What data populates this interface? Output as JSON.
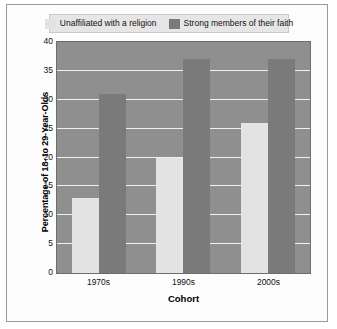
{
  "chart_data": {
    "type": "bar",
    "title": "",
    "xlabel": "Cohort",
    "ylabel": "Percentage of 18- to 29-Year-Olds",
    "categories": [
      "1970s",
      "1990s",
      "2000s"
    ],
    "ylim": [
      0,
      40
    ],
    "yticks": [
      0,
      5,
      10,
      15,
      20,
      25,
      30,
      35,
      40
    ],
    "grid": true,
    "legend_position": "top",
    "series": [
      {
        "name": "Unaffiliated with a religion",
        "color": "#e3e3e3",
        "values": [
          13,
          20,
          26
        ]
      },
      {
        "name": "Strong members of their faith",
        "color": "#7a7a7a",
        "values": [
          31,
          37,
          37
        ]
      }
    ],
    "plot_background": "#8f8f8f",
    "gridline_color": "#f0f0f0",
    "legend_background": "#e6e6e6"
  }
}
